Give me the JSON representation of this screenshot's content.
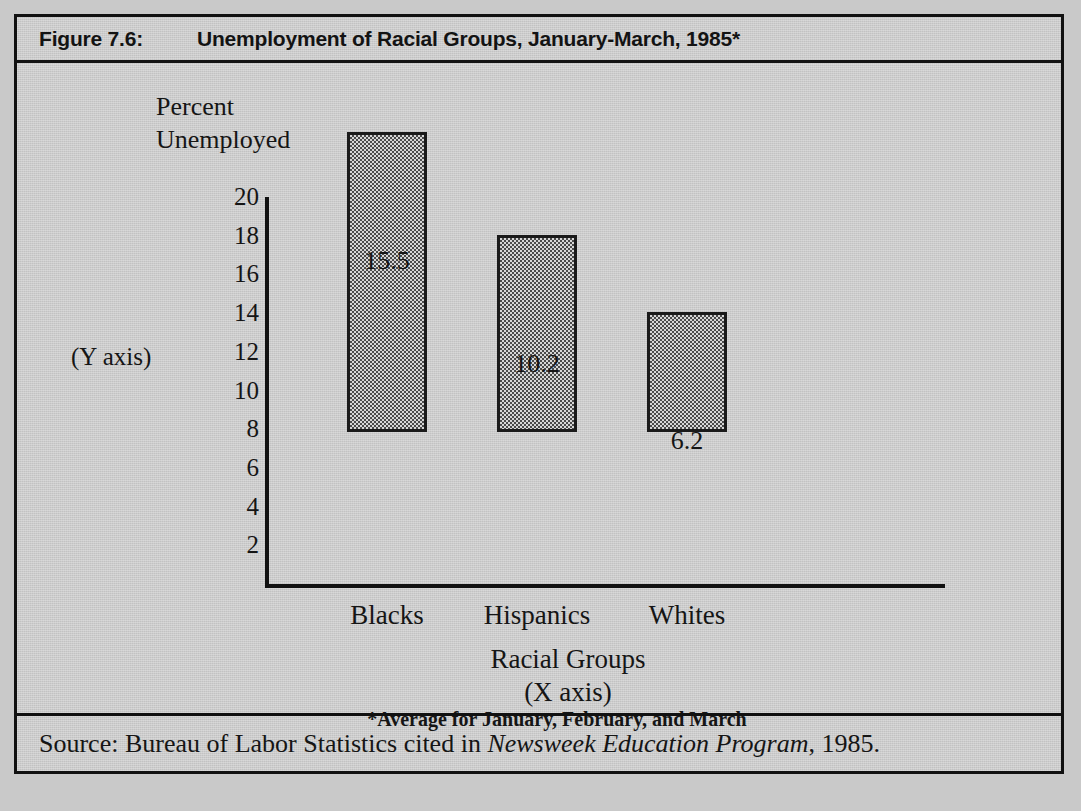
{
  "figure": {
    "number": "Figure 7.6:",
    "title": "Unemployment of Racial Groups, January-March, 1985*"
  },
  "axis_head_label": "Percent\nUnemployed",
  "y_axis_note": "(Y axis)",
  "x_axis_title": "Racial Groups\n(X axis)",
  "footnote": "*Average for January, February, and March",
  "source": {
    "prefix": "Source:  Bureau of Labor Statistics cited in ",
    "italic": "Newsweek Education Program",
    "suffix": ", 1985."
  },
  "colors": {
    "page_background": "#c9c9c9",
    "frame_background": "#cccccc",
    "ink": "#131313",
    "bar_fill_dark": "#4a4a4a",
    "bar_fill_light": "#d6d6d6",
    "bar_border": "#1a1a1a"
  },
  "chart_data": {
    "type": "bar",
    "title": "Unemployment of Racial Groups, January-March, 1985*",
    "categories": [
      "Blacks",
      "Hispanics",
      "Whites"
    ],
    "values": [
      15.5,
      10.2,
      6.2
    ],
    "value_labels": [
      "15.5",
      "10.2",
      "6.2"
    ],
    "xlabel": "Racial Groups",
    "ylabel": "Percent Unemployed",
    "ylim": [
      0,
      20
    ],
    "yticks": [
      20,
      18,
      16,
      14,
      12,
      10,
      8,
      6,
      4,
      2
    ],
    "ytick_labels": [
      "20",
      "18",
      "16",
      "14",
      "12",
      "10",
      "8",
      "6",
      "4",
      "2"
    ],
    "grid": false,
    "legend": false,
    "annotations": [
      "(Y axis)",
      "(X axis)",
      "*Average for January, February, and March"
    ]
  }
}
